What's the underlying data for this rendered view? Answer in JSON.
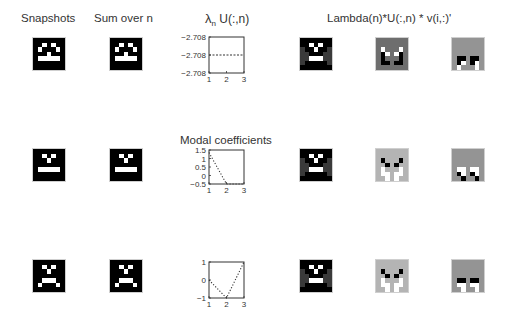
{
  "titles": {
    "snapshots": "Snapshots",
    "sum_over_n": "Sum over n",
    "lambda_u": "λ",
    "lambda_u_sub": "n",
    "lambda_u_rest": " U(:,n)",
    "modal_coefficients": "Modal coefficients",
    "reconstruction": "Lambda(n)*U(:,n) * v(i,:)'"
  },
  "colors": {
    "black": "#000000",
    "white": "#ffffff",
    "dark_gray": "#3a3a3a",
    "mid_gray": "#6e6e6e",
    "light_gray": "#b4b4b4",
    "gray": "#949494",
    "axis": "#333333"
  },
  "faces": {
    "smile": [
      "0000000",
      "0010100",
      "0100010",
      "0001000",
      "0111110",
      "0000000",
      "0000000"
    ],
    "neutral": [
      "0000000",
      "0010100",
      "0001000",
      "0000000",
      "0111110",
      "0000000",
      "0000000"
    ],
    "frown": [
      "0000000",
      "0010100",
      "0001000",
      "0000000",
      "0011100",
      "0100010",
      "0000000"
    ]
  },
  "chart_data": [
    {
      "type": "line",
      "title": "λn U(:,n)",
      "x": [
        1,
        2,
        3
      ],
      "values": [
        -2.708,
        -2.708,
        -2.708
      ],
      "yticks": [
        "-2.708",
        "-2.708",
        "-2.708"
      ],
      "xticks": [
        "1",
        "2",
        "3"
      ],
      "ylim": [
        -2.7085,
        -2.7075
      ],
      "linestyle": "dashed"
    },
    {
      "type": "line",
      "title": "Modal coefficients",
      "x": [
        1,
        2,
        3
      ],
      "values": [
        1.35,
        -0.5,
        -0.5
      ],
      "yticks": [
        "1.5",
        "1",
        "0.5",
        "0",
        "-0.5"
      ],
      "xticks": [
        "1",
        "2",
        "3"
      ],
      "ylim": [
        -0.5,
        1.5
      ],
      "linestyle": "dotted"
    },
    {
      "type": "line",
      "title": "",
      "x": [
        1,
        2,
        3
      ],
      "values": [
        0,
        -1,
        1
      ],
      "yticks": [
        "1",
        "0",
        "-1"
      ],
      "xticks": [
        "1",
        "2",
        "3"
      ],
      "ylim": [
        -1,
        1
      ],
      "linestyle": "dotted"
    }
  ]
}
